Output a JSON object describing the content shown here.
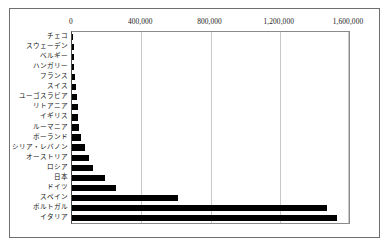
{
  "chart_data": {
    "type": "bar",
    "orientation": "horizontal",
    "title": "",
    "subtitle": "",
    "xlabel": "",
    "ylabel": "",
    "xlim": [
      0,
      1600000
    ],
    "ylim": null,
    "grid": true,
    "legend": null,
    "legend_position": "none",
    "axis_position": "top",
    "tick_labels": [
      "0",
      "400,000",
      "800,000",
      "1,200,000",
      "1,600,000"
    ],
    "tick_values": [
      0,
      400000,
      800000,
      1200000,
      1600000
    ],
    "bar_color": "#000000",
    "gridline_color": "#c9c9c9",
    "plot_border_color": "#8a8a8a",
    "frame_border_color": "#6f6f6f",
    "background_color": "#ffffff",
    "categories": [
      "チェコ",
      "スウェーデン",
      "ベルギー",
      "ハンガリー",
      "フランス",
      "スイス",
      "ユーゴスラビア",
      "リトアニア",
      "イギリス",
      "ルーマニア",
      "ポーランド",
      "シリア・レバノン",
      "オーストリア",
      "ロシア",
      "日本",
      "ドイツ",
      "スペイン",
      "ポルトガル",
      "イタリア"
    ],
    "values": [
      6000,
      9000,
      11000,
      14000,
      17000,
      23000,
      29000,
      32000,
      35000,
      40000,
      52000,
      75000,
      98000,
      121000,
      190000,
      254000,
      612000,
      1473000,
      1531000
    ]
  }
}
